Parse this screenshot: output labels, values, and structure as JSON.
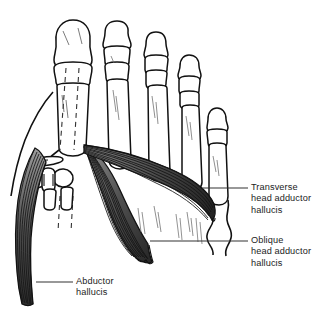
{
  "figure": {
    "background_color": "#ffffff",
    "outline_color": "#111111",
    "muscle_fill_color": "#6e6e6e",
    "text_color": "#1c1c1c"
  },
  "labels": {
    "transverse": {
      "line1": "Transverse",
      "line2": "head adductor",
      "line3": "hallucis"
    },
    "oblique": {
      "line1": "Oblique",
      "line2": "head adductor",
      "line3": "hallucis"
    },
    "abductor": {
      "line1": "Abductor",
      "line2": "hallucis"
    }
  }
}
